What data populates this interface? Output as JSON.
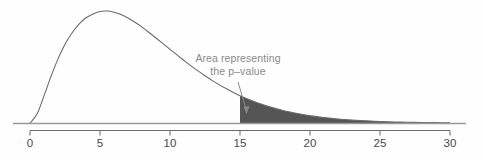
{
  "figure": {
    "name": "p-value-tail-area-plot",
    "background_color": "#fefefe"
  },
  "annotation": {
    "line1": "Area representing",
    "line2": "the p–value",
    "color": "#8a8a8a",
    "arrow_from": [
      238,
      82
    ],
    "arrow_to": [
      247,
      114
    ]
  },
  "axis": {
    "line_color": "#9a9a9a",
    "tick_color": "#6a6a6a",
    "label_color": "#4a4a4a"
  },
  "chart_data": {
    "type": "area",
    "title": "",
    "xlabel": "",
    "ylabel": "",
    "xlim": [
      0,
      30
    ],
    "ylim": [
      0,
      1.05
    ],
    "grid": false,
    "legend": null,
    "tick_labels": [
      "0",
      "5",
      "10",
      "15",
      "20",
      "25",
      "30"
    ],
    "tick_values": [
      0,
      5,
      10,
      15,
      20,
      25,
      30
    ],
    "curve_color": "#6b6b6b",
    "shade_color": "#555555",
    "shade_from": 15,
    "shade_to": 30,
    "peak_x": 4.1,
    "peak_y": 1.0,
    "x": [
      0.0,
      0.5,
      1.0,
      1.5,
      2.0,
      2.5,
      3.0,
      3.5,
      4.0,
      4.5,
      5.0,
      5.5,
      6.0,
      6.5,
      7.0,
      7.5,
      8.0,
      8.5,
      9.0,
      9.5,
      10.0,
      10.5,
      11.0,
      11.5,
      12.0,
      12.5,
      13.0,
      13.5,
      14.0,
      14.5,
      15.0,
      15.5,
      16.0,
      16.5,
      17.0,
      17.5,
      18.0,
      18.5,
      19.0,
      19.5,
      20.0,
      21.0,
      22.0,
      23.0,
      24.0,
      25.0,
      26.0,
      27.0,
      28.0,
      29.0,
      30.0
    ],
    "y": [
      0.0,
      0.079,
      0.241,
      0.414,
      0.57,
      0.7,
      0.8,
      0.879,
      0.935,
      0.97,
      0.991,
      0.995,
      0.985,
      0.964,
      0.933,
      0.895,
      0.852,
      0.805,
      0.756,
      0.706,
      0.655,
      0.605,
      0.556,
      0.508,
      0.463,
      0.42,
      0.379,
      0.341,
      0.306,
      0.273,
      0.243,
      0.216,
      0.191,
      0.168,
      0.148,
      0.13,
      0.114,
      0.099,
      0.086,
      0.075,
      0.065,
      0.048,
      0.035,
      0.026,
      0.019,
      0.013,
      0.009,
      0.007,
      0.005,
      0.003,
      0.002
    ]
  }
}
